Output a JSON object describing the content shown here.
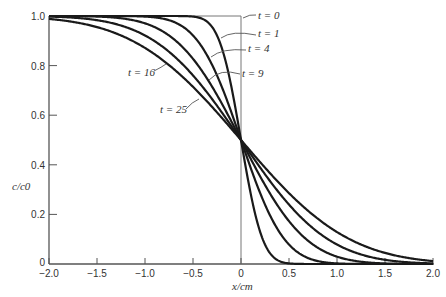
{
  "chart_data": {
    "type": "line",
    "title": "",
    "xlabel": "x/cm",
    "ylabel": "c/c0",
    "xlim": [
      -2.0,
      2.0
    ],
    "ylim": [
      0,
      1.0
    ],
    "grid": false,
    "x_ticks": [
      "-2.0",
      "-1.5",
      "-1.0",
      "-0.5",
      "0",
      "0.5",
      "1.0",
      "1.5",
      "2.0"
    ],
    "y_ticks": [
      "0",
      "0.2",
      "0.4",
      "0.6",
      "0.8",
      "1.0"
    ],
    "model": "c/c0 = 0.5 * erfc(x / (2*sqrt(D*t)))",
    "diffusion_coefficient": 0.0156,
    "series": [
      {
        "name": "t = 0",
        "t": 0
      },
      {
        "name": "t = 1",
        "t": 1
      },
      {
        "name": "t = 4",
        "t": 4
      },
      {
        "name": "t = 9",
        "t": 9
      },
      {
        "name": "t = 16",
        "t": 16
      },
      {
        "name": "t = 25",
        "t": 25
      }
    ],
    "annotations": [
      {
        "text": "t = 0",
        "x": 258,
        "y": 19
      },
      {
        "text": "t = 1",
        "x": 258,
        "y": 37
      },
      {
        "text": "t = 4",
        "x": 248,
        "y": 52
      },
      {
        "text": "t = 9",
        "x": 242,
        "y": 77
      },
      {
        "text": "t = 16",
        "x": 128,
        "y": 76
      },
      {
        "text": "t = 25",
        "x": 160,
        "y": 113
      }
    ],
    "legend": "inline annotations with arrows"
  }
}
